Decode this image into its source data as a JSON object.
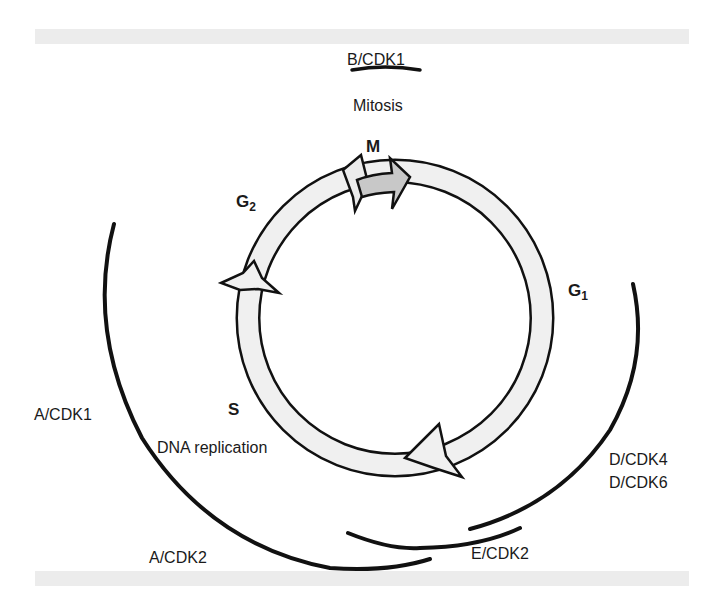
{
  "diagram": {
    "type": "cell-cycle",
    "phases": {
      "m": {
        "label": "M",
        "sub": ""
      },
      "g1": {
        "label": "G",
        "sub": "1"
      },
      "s": {
        "label": "S",
        "sub": ""
      },
      "g2": {
        "label": "G",
        "sub": "2"
      }
    },
    "process_labels": {
      "mitosis": "Mitosis",
      "dna_replication": "DNA replication"
    },
    "cyclin_cdk_complexes": {
      "b_cdk1": "B/CDK1",
      "a_cdk1": "A/CDK1",
      "a_cdk2": "A/CDK2",
      "e_cdk2": "E/CDK2",
      "d_cdk4": "D/CDK4",
      "d_cdk6": "D/CDK6"
    },
    "colors": {
      "ring_fill": "#f0f0f0",
      "m_arrow_fill": "#c8c8c8",
      "stroke": "#111111",
      "band": "#ececec"
    }
  }
}
